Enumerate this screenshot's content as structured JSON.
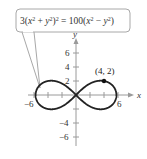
{
  "chart_data": {
    "type": "line",
    "title": "",
    "equation": "3(x² + y²)² = 100(x² − y²)",
    "curve": "lemniscate",
    "xlabel": "x",
    "ylabel": "y",
    "xlim": [
      -6,
      6
    ],
    "ylim": [
      -6,
      6
    ],
    "x_ticks": [
      -6,
      -4,
      -2,
      2,
      4,
      6
    ],
    "y_ticks": [
      -6,
      -4,
      -2,
      2,
      4,
      6
    ],
    "x_tick_labels_shown": [
      "-6",
      "6"
    ],
    "y_tick_labels_shown": [
      "6",
      "4",
      "2",
      "-4",
      "-6"
    ],
    "grid": false,
    "annotations": [
      {
        "type": "point",
        "x": 4,
        "y": 2,
        "label": "(4, 2)"
      },
      {
        "type": "callout",
        "text": "3(x² + y²)² = 100(x² − y²)"
      }
    ],
    "series": [
      {
        "name": "lemniscate",
        "a_squared": 33.33,
        "x_extent": [
          -5.77,
          5.77
        ]
      }
    ]
  },
  "labels": {
    "x_axis": "x",
    "y_axis": "y",
    "point": "(4, 2)",
    "x_neg6": "−6",
    "x_pos6": "6",
    "y6": "6",
    "y4": "4",
    "y2": "2",
    "yneg4": "−4",
    "yneg6": "−6"
  },
  "colors": {
    "curve": "#222222",
    "axis": "#9a9a9a",
    "callout_border": "#9a9a9a"
  }
}
